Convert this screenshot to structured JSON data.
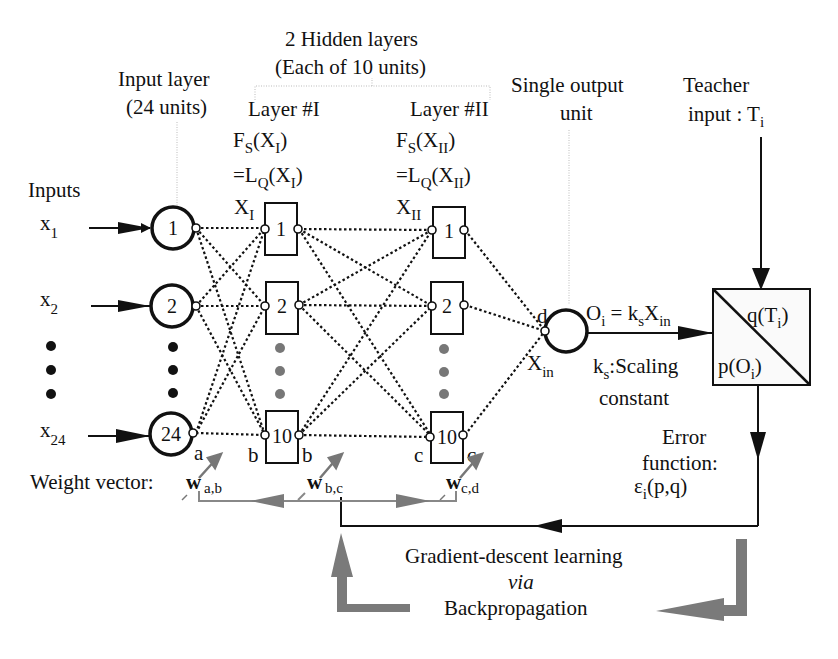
{
  "title": {
    "hidden_layers": "2 Hidden layers",
    "hidden_layers_sub": "(Each of 10 units)",
    "input_layer": "Input layer",
    "input_layer_sub": "(24 units)",
    "layer_one": "Layer #I",
    "layer_two": "Layer #II",
    "output_unit": "Single output",
    "output_unit_sub": "unit",
    "teacher": "Teacher",
    "teacher_sub_prefix": "input : T",
    "teacher_sub_index": "i"
  },
  "layer_one_formula": {
    "line1_f": "F",
    "line1_fsub": "S",
    "line1_open": "(X",
    "line1_xsub": "I",
    "line1_close": ")",
    "line2_eq": "=L",
    "line2_lsub": "Q",
    "line2_open": "(X",
    "line2_xsub": "I",
    "line2_close": ")",
    "x_label": "X",
    "x_sub": "I"
  },
  "layer_two_formula": {
    "line1_f": "F",
    "line1_fsub": "S",
    "line1_open": "(X",
    "line1_xsub": "II",
    "line1_close": ")",
    "line2_eq": "=L",
    "line2_lsub": "Q",
    "line2_open": "(X",
    "line2_xsub": "II",
    "line2_close": ")",
    "x_label": "X",
    "x_sub": "II"
  },
  "inputs": {
    "heading": "Inputs",
    "items": [
      {
        "var": "x",
        "index": "1",
        "node": "1"
      },
      {
        "var": "x",
        "index": "2",
        "node": "2"
      },
      {
        "var": "x",
        "index": "24",
        "node": "24"
      }
    ]
  },
  "hidden_one": {
    "nodes": [
      "1",
      "2",
      "10"
    ]
  },
  "hidden_two": {
    "nodes": [
      "1",
      "2",
      "10"
    ]
  },
  "port_labels": {
    "a": "a",
    "b_left": "b",
    "b_right": "b",
    "c_left": "c",
    "c_right": "c",
    "d": "d"
  },
  "output": {
    "x_label": "X",
    "x_sub": "in",
    "eq_o": "O",
    "eq_osub": "i",
    "eq_mid": " = k",
    "eq_ksub": "s",
    "eq_x": "X",
    "eq_xsub": "in",
    "k_label": "k",
    "k_sub": "s",
    "k_desc": ":Scaling",
    "k_desc2": "constant"
  },
  "teacher_box": {
    "q": "q(T",
    "q_sub": "i",
    "q_close": ")",
    "p": "p(O",
    "p_sub": "i",
    "p_close": ")"
  },
  "error": {
    "line1": "Error",
    "line2": "function:",
    "eps": "ε",
    "eps_sub": "i",
    "eps_args": "(p,q)"
  },
  "weights": {
    "label": "Weight vector:",
    "items": [
      {
        "w": "w",
        "sub": "a,b"
      },
      {
        "w": "w",
        "sub": "b,c"
      },
      {
        "w": "w",
        "sub": "c,d"
      }
    ]
  },
  "learning": {
    "line1": "Gradient-descent learning",
    "line2": "via",
    "line3": "Backpropagation"
  },
  "colors": {
    "ink": "#111111",
    "feedback_arrow": "#7a7a7a",
    "ellipsis_dots_hidden": "#777777"
  }
}
